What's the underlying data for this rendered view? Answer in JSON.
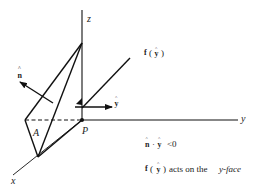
{
  "diagram": {
    "axes": {
      "z_label": "z",
      "y_label": "y",
      "x_label": "x"
    },
    "points": {
      "origin_label": "P",
      "area_label": "A"
    },
    "vectors": {
      "normal_label": "n",
      "normal_hat": "^",
      "unit_y_label": "y",
      "unit_y_hat": "^",
      "force_label_f": "f",
      "force_label_open": "(",
      "force_label_y": "y",
      "force_label_hat": "^",
      "force_label_close": ")"
    },
    "annotations": {
      "dot_n": "n",
      "dot_n_hat": "^",
      "dot_op": "·",
      "dot_y": "y",
      "dot_y_hat": "^",
      "dot_relation": "<0",
      "face_f": "f",
      "face_open": "(",
      "face_y": "y",
      "face_y_hat": "^",
      "face_close": ")",
      "face_text": "acts on the",
      "face_name": "y-face"
    },
    "colors": {
      "line": "#111111",
      "text": "#222222",
      "background": "#ffffff"
    }
  }
}
